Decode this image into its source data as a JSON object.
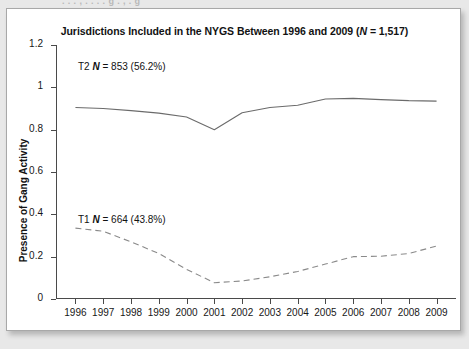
{
  "page": {
    "background_color": "#e8e8e8",
    "card_background": "#ffffff",
    "bleed_text": "the top of this figure is clipped by the page above"
  },
  "chart_data": {
    "type": "line",
    "title": "Jurisdictions Included in the NYGS Between 1996 and 2009 (N = 1,517)",
    "title_parts": {
      "before": "Jurisdictions Included in the NYGS Between 1996 and 2009 (",
      "italic": "N",
      "after": " = 1,517)"
    },
    "xlabel": "",
    "ylabel": "Presence of Gang Activity",
    "x": [
      1996,
      1997,
      1998,
      1999,
      2000,
      2001,
      2002,
      2003,
      2004,
      2005,
      2006,
      2007,
      2008,
      2009
    ],
    "categories": [
      "1996",
      "1997",
      "1998",
      "1999",
      "2000",
      "2001",
      "2002",
      "2003",
      "2004",
      "2005",
      "2006",
      "2007",
      "2008",
      "2009"
    ],
    "ylim": [
      0,
      1.2
    ],
    "yticks": [
      0,
      0.2,
      0.4,
      0.6,
      0.8,
      1,
      1.2
    ],
    "ytick_labels": [
      "0",
      "0.2",
      "0.4",
      "0.6",
      "0.8",
      "1",
      "1.2"
    ],
    "grid": false,
    "legend_position": "inline-annotation",
    "line_color": "#6b6b6b",
    "series": [
      {
        "name": "T2",
        "label": "T2  N = 853 (56.2%)",
        "label_parts": {
          "prefix": "T2  ",
          "italic": "N",
          "suffix": " = 853 (56.2%)"
        },
        "n": 853,
        "percent": "56.2%",
        "style": "solid",
        "values": [
          0.905,
          0.9,
          0.89,
          0.878,
          0.86,
          0.8,
          0.88,
          0.905,
          0.915,
          0.945,
          0.948,
          0.942,
          0.937,
          0.935
        ]
      },
      {
        "name": "T1",
        "label": "T1  N = 664 (43.8%)",
        "label_parts": {
          "prefix": "T1  ",
          "italic": "N",
          "suffix": " = 664 (43.8%)"
        },
        "n": 664,
        "percent": "43.8%",
        "style": "dashed",
        "values": [
          0.335,
          0.32,
          0.27,
          0.215,
          0.14,
          0.077,
          0.085,
          0.105,
          0.13,
          0.165,
          0.2,
          0.202,
          0.215,
          0.25
        ]
      }
    ]
  }
}
